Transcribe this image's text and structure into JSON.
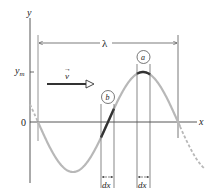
{
  "figure": {
    "axes": {
      "y_label": "y",
      "x_label": "x",
      "origin_label": "0",
      "amplitude_label": "y",
      "amplitude_subscript": "m"
    },
    "wavelength_label": "λ",
    "velocity_label": "v",
    "velocity_arrow_symbol": "→",
    "elements": [
      {
        "id": "a",
        "label": "a",
        "position": "crest",
        "width_label": "dx"
      },
      {
        "id": "b",
        "label": "b",
        "position": "zero-crossing",
        "width_label": "dx"
      }
    ],
    "colors": {
      "wave": "#b8b8b8",
      "highlight": "#333333",
      "axes": "#444444",
      "guide": "#555555"
    }
  }
}
